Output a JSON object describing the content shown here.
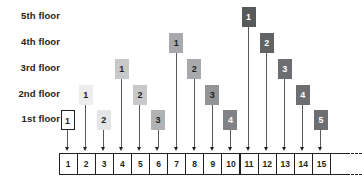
{
  "diagram": {
    "floor_labels": [
      {
        "id": "floor-5",
        "label": "5th floor",
        "level": 5
      },
      {
        "id": "floor-4",
        "label": "4th floor",
        "level": 4
      },
      {
        "id": "floor-3",
        "label": "3rd floor",
        "level": 3
      },
      {
        "id": "floor-2",
        "label": "2nd floor",
        "level": 2
      },
      {
        "id": "floor-1",
        "label": "1st floor",
        "level": 1
      }
    ],
    "colors": {
      "floor_1_fill": "#ffffff",
      "floor_2_fill": "#e6e7e8",
      "floor_3_fill": "#c7c8ca",
      "floor_4_fill": "#a7a9ac",
      "floor_5_fill": "#808285",
      "shade_1": "#ededee",
      "shade_2": "#d5d6d8",
      "shade_3": "#a7a9ac",
      "shade_4": "#808285",
      "shade_5": "#58595b",
      "line": "#58595b",
      "ink": "#231f20",
      "background": "#ffffff"
    },
    "probes": [
      {
        "column": 1,
        "floor": 1,
        "label": "1",
        "fill": "#ffffff",
        "text": "#231f20",
        "outlined": true
      },
      {
        "column": 2,
        "floor": 2,
        "label": "1",
        "fill": "#ededee",
        "text": "#231f20",
        "outlined": false
      },
      {
        "column": 3,
        "floor": 1,
        "label": "2",
        "fill": "#e4e5e6",
        "text": "#231f20",
        "outlined": false
      },
      {
        "column": 4,
        "floor": 3,
        "label": "1",
        "fill": "#c7c8ca",
        "text": "#231f20",
        "outlined": false
      },
      {
        "column": 5,
        "floor": 2,
        "label": "2",
        "fill": "#c7c8ca",
        "text": "#231f20",
        "outlined": false
      },
      {
        "column": 6,
        "floor": 1,
        "label": "3",
        "fill": "#b0b2b4",
        "text": "#231f20",
        "outlined": false
      },
      {
        "column": 7,
        "floor": 4,
        "label": "1",
        "fill": "#a7a9ac",
        "text": "#231f20",
        "outlined": false
      },
      {
        "column": 8,
        "floor": 3,
        "label": "2",
        "fill": "#a7a9ac",
        "text": "#231f20",
        "outlined": false
      },
      {
        "column": 9,
        "floor": 2,
        "label": "3",
        "fill": "#929497",
        "text": "#231f20",
        "outlined": false
      },
      {
        "column": 10,
        "floor": 1,
        "label": "4",
        "fill": "#808285",
        "text": "#ffffff",
        "outlined": false
      },
      {
        "column": 11,
        "floor": 5,
        "label": "1",
        "fill": "#58595b",
        "text": "#ffffff",
        "outlined": false
      },
      {
        "column": 12,
        "floor": 4,
        "label": "2",
        "fill": "#616365",
        "text": "#ffffff",
        "outlined": false
      },
      {
        "column": 13,
        "floor": 3,
        "label": "3",
        "fill": "#6d6e71",
        "text": "#ffffff",
        "outlined": false
      },
      {
        "column": 14,
        "floor": 2,
        "label": "4",
        "fill": "#6d6e71",
        "text": "#ffffff",
        "outlined": false
      },
      {
        "column": 15,
        "floor": 1,
        "label": "5",
        "fill": "#6d6e71",
        "text": "#ffffff",
        "outlined": false
      }
    ],
    "array": {
      "name": "hash-table-slots",
      "cells": [
        "1",
        "2",
        "3",
        "4",
        "5",
        "6",
        "7",
        "8",
        "9",
        "10",
        "11",
        "12",
        "13",
        "14",
        "15"
      ],
      "trailing_cell_label": "",
      "continues": true
    }
  }
}
